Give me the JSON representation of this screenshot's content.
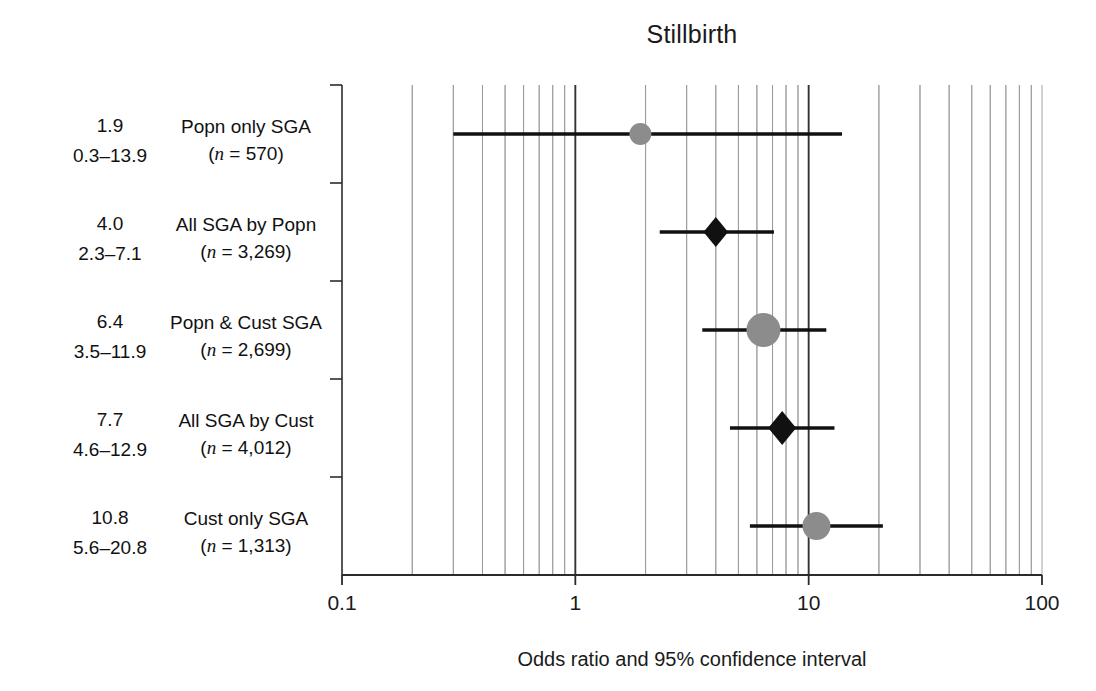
{
  "chart_data": {
    "type": "scatter",
    "subtype": "forest-plot",
    "title": "Stillbirth",
    "xlabel": "Odds ratio and 95% confidence interval",
    "ylabel": "",
    "xscale": "log",
    "xlim": [
      0.1,
      100
    ],
    "xticks": [
      0.1,
      1,
      10,
      100
    ],
    "xtick_labels": [
      "0.1",
      "1",
      "10",
      "100"
    ],
    "grid": "vertical-log-minor",
    "reference_lines": [
      1,
      10
    ],
    "legend": "none",
    "categories": [
      "Popn only SGA",
      "All SGA by Popn",
      "Popn & Cust SGA",
      "All SGA by Cust",
      "Cust only SGA"
    ],
    "values": [
      1.9,
      4.0,
      6.4,
      7.7,
      10.8
    ],
    "ci_low": [
      0.3,
      2.3,
      3.5,
      4.6,
      5.6
    ],
    "ci_high": [
      13.9,
      7.1,
      11.9,
      12.9,
      20.8
    ],
    "n": [
      570,
      3269,
      4012,
      2699,
      1313
    ],
    "rows": [
      {
        "or": "1.9",
        "ci": "0.3–13.9",
        "label": "Popn only SGA",
        "n_text": "(n = 570)",
        "n_value": "570",
        "value": 1.9,
        "low": 0.3,
        "high": 13.9,
        "marker": "circle",
        "marker_color": "#8c8c8c",
        "marker_size": 11
      },
      {
        "or": "4.0",
        "ci": "2.3–7.1",
        "label": "All SGA by Popn",
        "n_text": "(n = 3,269)",
        "n_value": "3,269",
        "value": 4.0,
        "low": 2.3,
        "high": 7.1,
        "marker": "diamond",
        "marker_color": "#111111",
        "marker_size": 15
      },
      {
        "or": "6.4",
        "ci": "3.5–11.9",
        "label": "Popn & Cust SGA",
        "n_text": "(n = 2,699)",
        "n_value": "2,699",
        "value": 6.4,
        "low": 3.5,
        "high": 11.9,
        "marker": "circle",
        "marker_color": "#8c8c8c",
        "marker_size": 17
      },
      {
        "or": "7.7",
        "ci": "4.6–12.9",
        "label": "All SGA by Cust",
        "n_text": "(n = 4,012)",
        "n_value": "4,012",
        "value": 7.7,
        "low": 4.6,
        "high": 12.9,
        "marker": "diamond",
        "marker_color": "#111111",
        "marker_size": 17
      },
      {
        "or": "10.8",
        "ci": "5.6–20.8",
        "label": "Cust only SGA",
        "n_text": "(n = 1,313)",
        "n_value": "1,313",
        "value": 10.8,
        "low": 5.6,
        "high": 20.8,
        "marker": "circle",
        "marker_color": "#8c8c8c",
        "marker_size": 14
      }
    ]
  },
  "colors": {
    "axis": "#2b2b2b",
    "grid_minor": "#9a9a9a",
    "grid_major": "#333333",
    "ci_line": "#111111",
    "marker_grey": "#8c8c8c",
    "marker_black": "#111111",
    "text": "#1a1a1a",
    "background": "#ffffff"
  }
}
